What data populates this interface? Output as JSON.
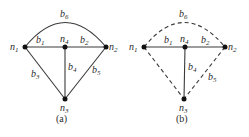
{
  "figures": [
    {
      "id": "a",
      "caption": "(a)",
      "nodes": [
        {
          "name": "n",
          "sub": "1",
          "x": 25,
          "y": 47
        },
        {
          "name": "n",
          "sub": "4",
          "x": 65,
          "y": 47
        },
        {
          "name": "n",
          "sub": "2",
          "x": 106,
          "y": 47
        },
        {
          "name": "n",
          "sub": "3",
          "x": 65,
          "y": 99
        }
      ],
      "edges": [
        {
          "name": "b",
          "sub": "1",
          "from": "n1",
          "to": "n4",
          "style": "solid"
        },
        {
          "name": "b",
          "sub": "2",
          "from": "n4",
          "to": "n2",
          "style": "solid"
        },
        {
          "name": "b",
          "sub": "3",
          "from": "n1",
          "to": "n3",
          "style": "solid"
        },
        {
          "name": "b",
          "sub": "4",
          "from": "n4",
          "to": "n3",
          "style": "solid"
        },
        {
          "name": "b",
          "sub": "5",
          "from": "n2",
          "to": "n3",
          "style": "solid"
        },
        {
          "name": "b",
          "sub": "6",
          "from": "n1",
          "to": "n2",
          "style": "solid-arc"
        }
      ]
    },
    {
      "id": "b",
      "caption": "(b)",
      "nodes": [
        {
          "name": "n",
          "sub": "1",
          "x": 144,
          "y": 47
        },
        {
          "name": "n",
          "sub": "4",
          "x": 185,
          "y": 47
        },
        {
          "name": "n",
          "sub": "2",
          "x": 225,
          "y": 47
        },
        {
          "name": "n",
          "sub": "3",
          "x": 184,
          "y": 99
        }
      ],
      "edges": [
        {
          "name": "b",
          "sub": "1",
          "from": "n1",
          "to": "n4",
          "style": "solid"
        },
        {
          "name": "b",
          "sub": "2",
          "from": "n4",
          "to": "n2",
          "style": "solid"
        },
        {
          "name": "b",
          "sub": "3",
          "from": "n1",
          "to": "n3",
          "style": "dashed"
        },
        {
          "name": "b",
          "sub": "4",
          "from": "n4",
          "to": "n3",
          "style": "solid"
        },
        {
          "name": "b",
          "sub": "5",
          "from": "n2",
          "to": "n3",
          "style": "dashed"
        },
        {
          "name": "b",
          "sub": "6",
          "from": "n1",
          "to": "n2",
          "style": "dashed-arc"
        }
      ]
    }
  ],
  "labels": {
    "n_letter": "n",
    "b_letter": "b",
    "s1": "1",
    "s2": "2",
    "s3": "3",
    "s4": "4",
    "s5": "5",
    "s6": "6",
    "cap_a": "(a)",
    "cap_b": "(b)"
  }
}
